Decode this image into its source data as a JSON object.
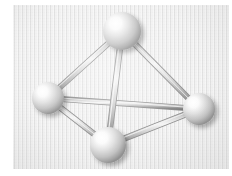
{
  "figure": {
    "background_color": "#ffffff",
    "panel_color": "#e9e9e9",
    "panel": {
      "x": 13,
      "y": 5,
      "width": 216,
      "height": 164
    },
    "sphere_color_highlight": "#ffffff",
    "sphere_color_mid": "#d9d9d9",
    "sphere_color_shadow": "#8f8f8f",
    "bond_color_light": "#f2f2f2",
    "bond_color_mid": "#b9b9b9",
    "bond_color_dark": "#7c7c7c"
  },
  "chart_data": {
    "type": "scatter",
    "xlabel": "",
    "ylabel": "",
    "xlim": [
      0,
      216
    ],
    "ylim": [
      0,
      164
    ],
    "grid": false,
    "legend": "none",
    "atoms": [
      {
        "id": "top",
        "label": "top atom",
        "cx": 109,
        "cy": 26,
        "r": 19
      },
      {
        "id": "left",
        "label": "left atom",
        "cx": 35,
        "cy": 93,
        "r": 16
      },
      {
        "id": "right",
        "label": "right atom",
        "cx": 186,
        "cy": 104,
        "r": 16
      },
      {
        "id": "bottom",
        "label": "bottom front atom",
        "cx": 95,
        "cy": 140,
        "r": 18
      }
    ],
    "bonds": [
      {
        "id": "top-left",
        "from": "top",
        "to": "left",
        "depth": "front"
      },
      {
        "id": "top-right",
        "from": "top",
        "to": "right",
        "depth": "front"
      },
      {
        "id": "top-bottom",
        "from": "top",
        "to": "bottom",
        "depth": "front"
      },
      {
        "id": "left-right",
        "from": "left",
        "to": "right",
        "depth": "back"
      },
      {
        "id": "left-bottom",
        "from": "left",
        "to": "bottom",
        "depth": "front"
      },
      {
        "id": "bottom-right",
        "from": "bottom",
        "to": "right",
        "depth": "front"
      }
    ],
    "atom_count": 4,
    "bond_count": 6
  }
}
